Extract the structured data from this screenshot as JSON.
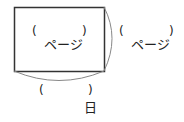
{
  "diagram": {
    "inner_box": {
      "blank_open": "(",
      "blank_close": ")",
      "unit": "ページ"
    },
    "right_brace": {
      "blank_open": "(",
      "blank_close": ")",
      "unit": "ページ"
    },
    "bottom_brace": {
      "blank_open": "(",
      "blank_close": ")",
      "unit": "日"
    },
    "colors": {
      "line": "#333333",
      "brace": "#888888"
    }
  }
}
